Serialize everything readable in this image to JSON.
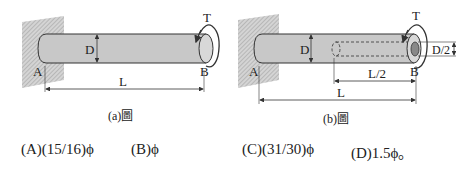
{
  "figure_a": {
    "caption": "(a)圖",
    "labels": {
      "torque": "T",
      "diameter": "D",
      "end_a": "A",
      "end_b": "B",
      "length": "L"
    }
  },
  "figure_b": {
    "caption": "(b)圖",
    "labels": {
      "torque": "T",
      "diameter": "D",
      "inner_diameter": "D/2",
      "end_a": "A",
      "end_b": "B",
      "half_length": "L/2",
      "length": "L"
    }
  },
  "options": [
    {
      "key": "A",
      "text": "(A)(15/16)ϕ"
    },
    {
      "key": "B",
      "text": "(B)ϕ"
    },
    {
      "key": "C",
      "text": "(C)(31/30)ϕ"
    },
    {
      "key": "D",
      "text": "(D)1.5ϕ。"
    }
  ],
  "colors": {
    "shaft_fill": "#c8c8c8",
    "wall_fill": "#b8b8b8",
    "outline": "#333333"
  }
}
